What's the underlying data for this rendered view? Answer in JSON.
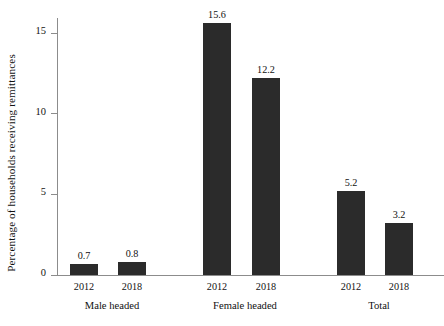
{
  "chart_data": {
    "type": "bar",
    "title": "",
    "xlabel": "",
    "ylabel": "Percentage of households receiving remittances",
    "ylim": [
      0,
      16.5
    ],
    "yticks": [
      0,
      5,
      10,
      15
    ],
    "ytick_labels": [
      "0",
      "5",
      "10",
      "15"
    ],
    "grid": false,
    "legend": null,
    "bar_color": "#2b2b2b",
    "background_color": "#ffffff",
    "axis_color": "#8c8c8c",
    "groups": [
      {
        "label": "Male headed",
        "categories": [
          "2012",
          "2018"
        ],
        "values": [
          0.7,
          0.8
        ],
        "value_labels": [
          "0.7",
          "0.8"
        ]
      },
      {
        "label": "Female headed",
        "categories": [
          "2012",
          "2018"
        ],
        "values": [
          15.6,
          12.2
        ],
        "value_labels": [
          "15.6",
          "12.2"
        ]
      },
      {
        "label": "Total",
        "categories": [
          "2012",
          "2018"
        ],
        "values": [
          5.2,
          3.2
        ],
        "value_labels": [
          "5.2",
          "3.2"
        ]
      }
    ],
    "categories": [
      "Male headed 2012",
      "Male headed 2018",
      "Female headed 2012",
      "Female headed 2018",
      "Total 2012",
      "Total 2018"
    ],
    "values": [
      0.7,
      0.8,
      15.6,
      12.2,
      5.2,
      3.2
    ]
  }
}
